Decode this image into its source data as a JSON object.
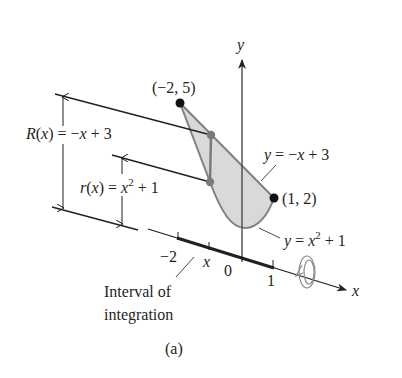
{
  "figure": {
    "caption": "(a)",
    "axes": {
      "x_label": "x",
      "y_label": "y",
      "origin_label": "0",
      "ticks": [
        {
          "value": "−2",
          "id": "tick-neg2"
        },
        {
          "value": "x",
          "id": "tick-x"
        },
        {
          "value": "1",
          "id": "tick-1"
        }
      ]
    },
    "points": [
      {
        "label": "(−2, 5)",
        "x": -2,
        "y": 5
      },
      {
        "label": "(1, 2)",
        "x": 1,
        "y": 2
      }
    ],
    "curves": [
      {
        "label": "y = −x + 3",
        "expr_prefix": "y = −x + 3"
      },
      {
        "label": "y = x² + 1",
        "expr_prefix": "y = x",
        "exp": "2",
        "expr_suffix": " + 1"
      }
    ],
    "radii": {
      "outer": {
        "name": "R(x)",
        "eq": " = −x + 3"
      },
      "inner": {
        "name": "r(x)",
        "eq_prefix": " = x",
        "exp": "2",
        "eq_suffix": " + 1"
      }
    },
    "interval_label_line1": "Interval of",
    "interval_label_line2": "integration",
    "colors": {
      "region_fill": "#d9d9d9",
      "region_stroke": "#808080",
      "ink": "#231f20",
      "gray_point": "#7a7a7a"
    }
  }
}
